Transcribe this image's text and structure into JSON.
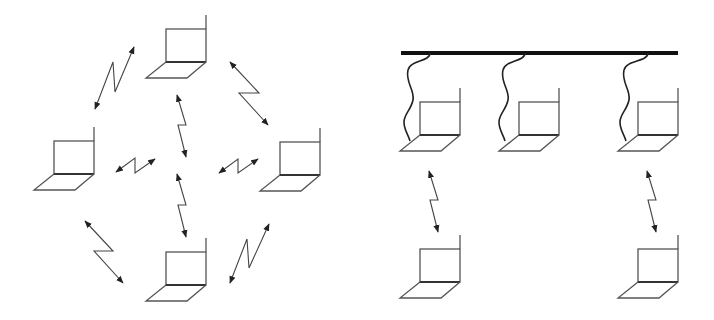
{
  "diagram": {
    "type": "network-topology-comparison",
    "colors": {
      "background": "#ffffff",
      "stroke": "#444444",
      "bus": "#111111"
    },
    "panels": [
      {
        "name": "ad-hoc-network",
        "description": "Peer-to-peer wireless mesh of four laptops",
        "nodes": [
          {
            "id": "top",
            "x": 166,
            "y": 29
          },
          {
            "id": "left",
            "x": 54,
            "y": 141
          },
          {
            "id": "right",
            "x": 280,
            "y": 142
          },
          {
            "id": "bottom",
            "x": 166,
            "y": 252
          }
        ],
        "links": [
          {
            "from": "top",
            "to": "left",
            "kind": "wireless"
          },
          {
            "from": "top",
            "to": "right",
            "kind": "wireless"
          },
          {
            "from": "top",
            "to": "bottom",
            "kind": "wireless"
          },
          {
            "from": "left",
            "to": "right",
            "kind": "wireless"
          },
          {
            "from": "left",
            "to": "bottom",
            "kind": "wireless"
          },
          {
            "from": "right",
            "to": "bottom",
            "kind": "wireless"
          }
        ]
      },
      {
        "name": "infrastructure-network",
        "description": "Wired backbone bus with three access-point laptops, two serving wireless clients",
        "backbone": {
          "x1": 401,
          "x2": 678,
          "y": 53
        },
        "nodes": [
          {
            "id": "ap1",
            "x": 420,
            "y": 102,
            "wired": true
          },
          {
            "id": "ap2",
            "x": 519,
            "y": 102,
            "wired": true
          },
          {
            "id": "ap3",
            "x": 638,
            "y": 102,
            "wired": true
          },
          {
            "id": "client1",
            "x": 420,
            "y": 249
          },
          {
            "id": "client3",
            "x": 638,
            "y": 249
          }
        ],
        "links": [
          {
            "from": "ap1",
            "to": "client1",
            "kind": "wireless"
          },
          {
            "from": "ap3",
            "to": "client3",
            "kind": "wireless"
          }
        ]
      }
    ]
  }
}
